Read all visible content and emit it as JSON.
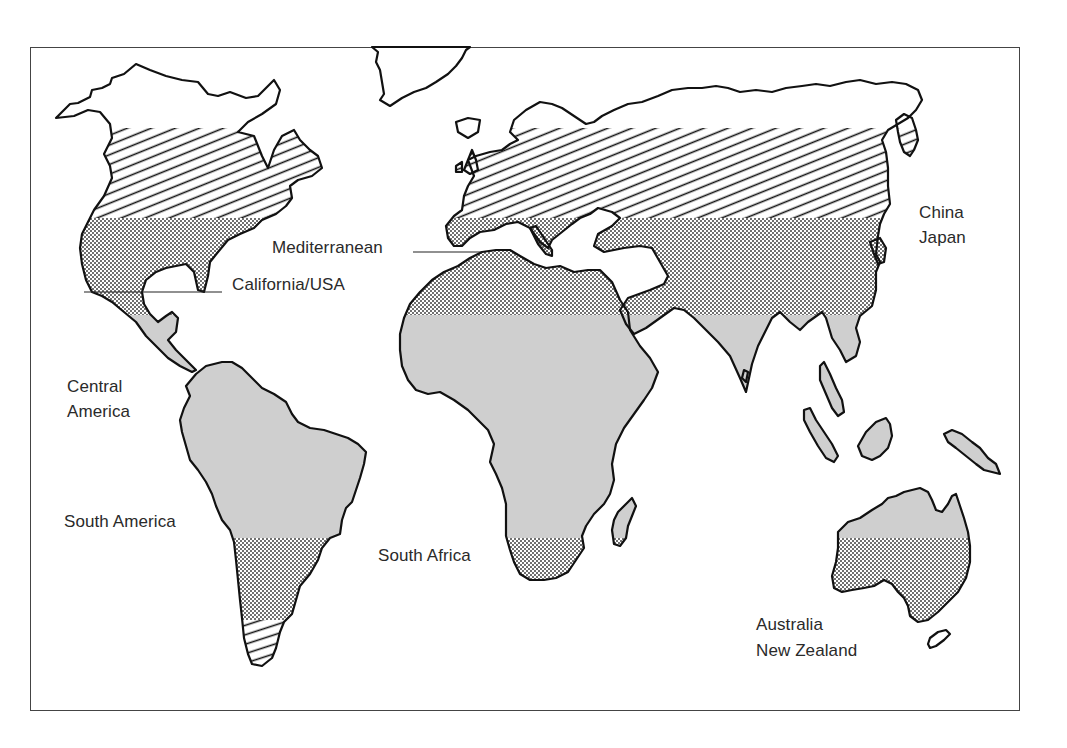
{
  "figure": {
    "type": "world-map",
    "frame_color": "#444444",
    "coastline_color": "#111111",
    "fill_colors": {
      "gray": "#cfcfcf",
      "dots": "#3a3a3a",
      "hatch": "#1a1a1a",
      "background": "#ffffff"
    },
    "legend_note": "Regions shaded by latitude band: hatched (north/south temperate), dotted (subtropical wine-growing zone), gray (tropical)"
  },
  "labels": {
    "mediterranean": "Mediterranean",
    "california": "California/USA",
    "china_japan_line1": "China",
    "china_japan_line2": "Japan",
    "central_america_line1": "Central",
    "central_america_line2": "America",
    "south_america": "South America",
    "south_africa": "South Africa",
    "australia_line1": "Australia",
    "australia_line2": "New Zealand"
  },
  "bands": [
    {
      "name": "northern-hatch",
      "pattern": "diagonal-hatch",
      "y_top": 128,
      "y_bottom": 218
    },
    {
      "name": "northern-dotted",
      "pattern": "dots",
      "y_top": 218,
      "y_bottom": 315
    },
    {
      "name": "tropical-gray",
      "pattern": "solid-gray",
      "y_top": 315,
      "y_bottom": 538
    },
    {
      "name": "southern-dotted",
      "pattern": "dots",
      "y_top": 538,
      "y_bottom": 620
    },
    {
      "name": "southern-hatch",
      "pattern": "horizontal-hatch",
      "y_top": 620,
      "y_bottom": 665
    }
  ]
}
